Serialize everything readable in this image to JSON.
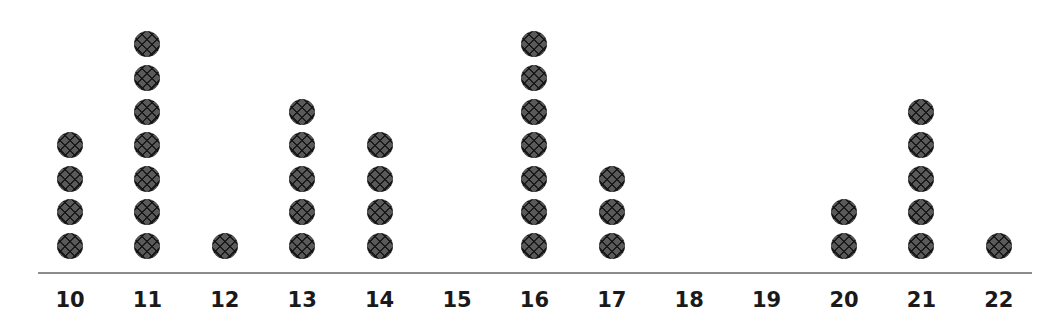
{
  "chart_data": {
    "type": "scatter",
    "subtype": "dot_plot",
    "title": "",
    "xlabel": "",
    "ylabel": "",
    "categories": [
      "10",
      "11",
      "12",
      "13",
      "14",
      "15",
      "16",
      "17",
      "18",
      "19",
      "20",
      "21",
      "22"
    ],
    "values": [
      4,
      7,
      1,
      5,
      4,
      0,
      7,
      3,
      0,
      0,
      2,
      5,
      1
    ],
    "x_range": [
      10,
      22
    ],
    "grid": false,
    "legend": null,
    "dot_color": "#5a5a5a",
    "axis_color": "#8c8c8c"
  },
  "axis": {
    "ticks": [
      "10",
      "11",
      "12",
      "13",
      "14",
      "15",
      "16",
      "17",
      "18",
      "19",
      "20",
      "21",
      "22"
    ]
  }
}
